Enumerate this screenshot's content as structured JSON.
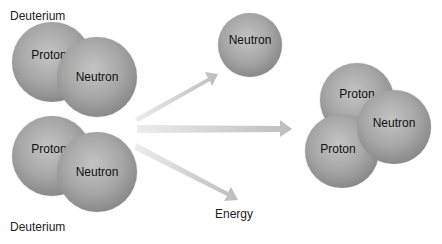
{
  "reactants": [
    {
      "label": "Deuterium",
      "particles": [
        "Proton",
        "Neutron"
      ]
    },
    {
      "label": "Deuterium",
      "particles": [
        "Proton",
        "Neutron"
      ]
    }
  ],
  "products": {
    "free_neutron": "Neutron",
    "helium_nucleus": [
      "Proton",
      "Neutron",
      "Proton"
    ],
    "energy_label": "Energy"
  },
  "colors": {
    "particle": "#a0a0a0",
    "arrow": "#c8c8c8"
  }
}
